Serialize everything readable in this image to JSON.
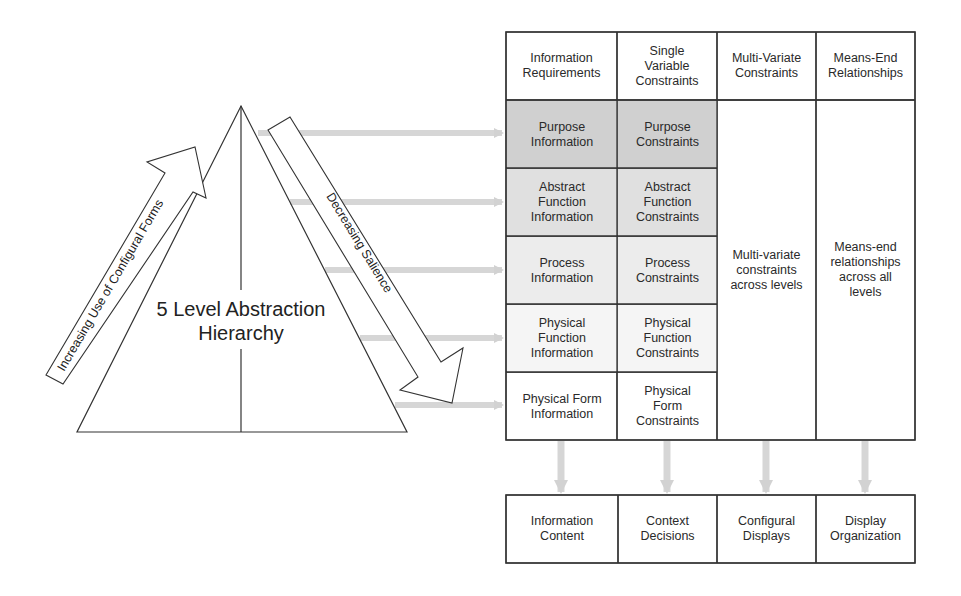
{
  "hierarchy": {
    "label": "5 Level Abstraction\nHierarchy",
    "increasing_arrow_label": "Increasing Use of Configural Forms",
    "decreasing_arrow_label": "Decreasing Salience"
  },
  "matrix": {
    "headers": [
      "Information\nRequirements",
      "Single\nVariable\nConstraints",
      "Multi-Variate\nConstraints",
      "Means-End\nRelationships"
    ],
    "rows": [
      {
        "level": "Purpose",
        "information": "Purpose\nInformation",
        "constraints": "Purpose\nConstraints",
        "shade": "#d0d0d0"
      },
      {
        "level": "Abstract Function",
        "information": "Abstract\nFunction\nInformation",
        "constraints": "Abstract\nFunction\nConstraints",
        "shade": "#e0e0e0"
      },
      {
        "level": "Process",
        "information": "Process\nInformation",
        "constraints": "Process\nConstraints",
        "shade": "#ececec"
      },
      {
        "level": "Physical Function",
        "information": "Physical\nFunction\nInformation",
        "constraints": "Physical\nFunction\nConstraints",
        "shade": "#f5f5f5"
      },
      {
        "level": "Physical Form",
        "information": "Physical Form\nInformation",
        "constraints": "Physical\nForm\nConstraints",
        "shade": "#ffffff"
      }
    ],
    "multivariate_span": "Multi-variate\nconstraints\nacross levels",
    "means_end_span": "Means-end\nrelationships\nacross all\nlevels"
  },
  "outputs": [
    "Information\nContent",
    "Context\nDecisions",
    "Configural\nDisplays",
    "Display\nOrganization"
  ],
  "colors": {
    "line": "#333333",
    "flow_arrow": "#d6d6d6"
  }
}
